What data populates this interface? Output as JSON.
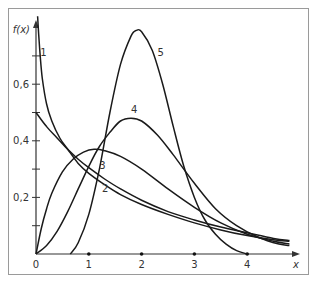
{
  "chart_data": {
    "type": "line",
    "title": "",
    "xlabel": "x",
    "ylabel": "f(x)",
    "xlim": [
      0,
      4.9
    ],
    "ylim": [
      0,
      0.83
    ],
    "grid": false,
    "legend": "inline curve labels",
    "x_ticks": [
      "0",
      "1",
      "2",
      "3",
      "4"
    ],
    "y_ticks": [
      "0,2",
      "0,4",
      "0,6"
    ],
    "y_minor_ticks": [
      0.1,
      0.3,
      0.5,
      0.7
    ],
    "series": [
      {
        "name": "1",
        "label_pos": [
          0.08,
          0.7
        ],
        "x": [
          0.03,
          0.05,
          0.08,
          0.12,
          0.2,
          0.3,
          0.45,
          0.6,
          0.8,
          1.0,
          1.3,
          1.6,
          2.0,
          2.5,
          3.0,
          3.5,
          4.0,
          4.5,
          4.8
        ],
        "y": [
          0.84,
          0.78,
          0.7,
          0.62,
          0.53,
          0.47,
          0.41,
          0.37,
          0.32,
          0.285,
          0.245,
          0.21,
          0.175,
          0.14,
          0.11,
          0.085,
          0.065,
          0.05,
          0.045
        ]
      },
      {
        "name": "2",
        "label_pos": [
          1.25,
          0.22
        ],
        "x": [
          0,
          0.2,
          0.4,
          0.6,
          0.8,
          1.0,
          1.3,
          1.6,
          2.0,
          2.5,
          3.0,
          3.5,
          4.0,
          4.5,
          4.8
        ],
        "y": [
          0.5,
          0.45,
          0.41,
          0.37,
          0.335,
          0.305,
          0.265,
          0.23,
          0.19,
          0.15,
          0.12,
          0.095,
          0.075,
          0.055,
          0.048
        ]
      },
      {
        "name": "3",
        "label_pos": [
          1.2,
          0.3
        ],
        "x": [
          0,
          0.1,
          0.2,
          0.3,
          0.5,
          0.7,
          0.9,
          1.1,
          1.3,
          1.6,
          2.0,
          2.5,
          3.0,
          3.5,
          4.0,
          4.5,
          4.8
        ],
        "y": [
          0,
          0.09,
          0.16,
          0.215,
          0.29,
          0.335,
          0.36,
          0.37,
          0.365,
          0.345,
          0.3,
          0.23,
          0.165,
          0.11,
          0.07,
          0.045,
          0.035
        ]
      },
      {
        "name": "4",
        "label_pos": [
          1.8,
          0.5
        ],
        "x": [
          0,
          0.2,
          0.4,
          0.6,
          0.8,
          1.0,
          1.2,
          1.4,
          1.6,
          1.8,
          2.0,
          2.3,
          2.6,
          3.0,
          3.4,
          3.8,
          4.2,
          4.6,
          4.8
        ],
        "y": [
          0,
          0.03,
          0.08,
          0.15,
          0.23,
          0.31,
          0.38,
          0.43,
          0.47,
          0.48,
          0.47,
          0.42,
          0.35,
          0.25,
          0.16,
          0.1,
          0.06,
          0.035,
          0.03
        ]
      },
      {
        "name": "5",
        "label_pos": [
          2.3,
          0.7
        ],
        "x": [
          0.65,
          0.8,
          1.0,
          1.2,
          1.4,
          1.6,
          1.8,
          1.9,
          2.0,
          2.2,
          2.4,
          2.6,
          2.8,
          3.0,
          3.2,
          3.4,
          3.6,
          3.8,
          4.0
        ],
        "y": [
          0,
          0.04,
          0.14,
          0.3,
          0.5,
          0.67,
          0.77,
          0.79,
          0.785,
          0.72,
          0.6,
          0.45,
          0.31,
          0.2,
          0.12,
          0.07,
          0.035,
          0.012,
          0
        ]
      }
    ]
  }
}
